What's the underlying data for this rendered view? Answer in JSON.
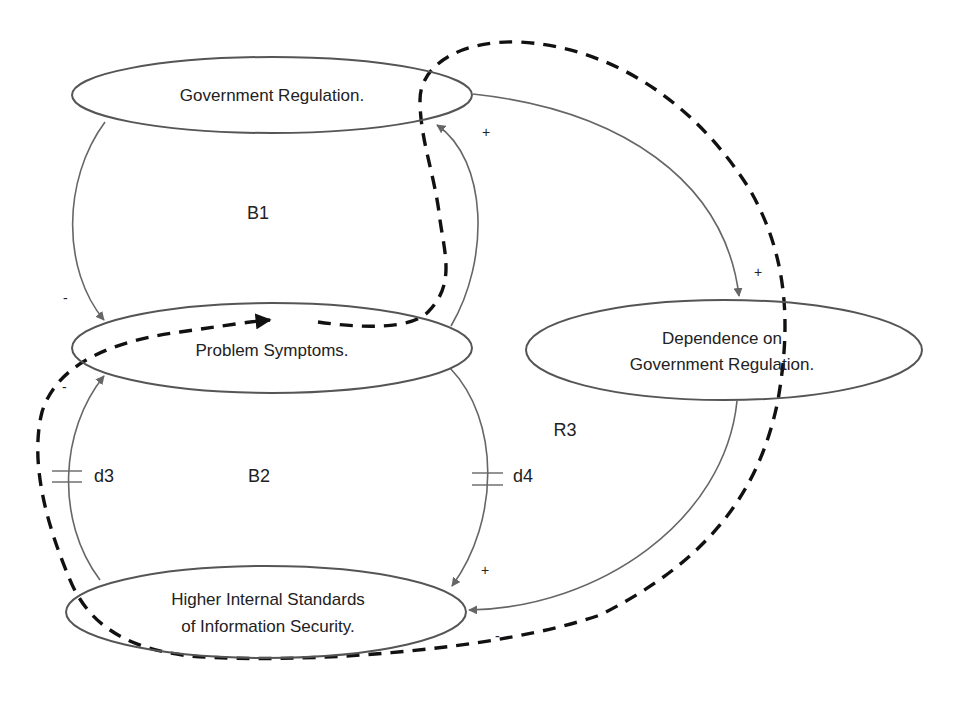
{
  "diagram": {
    "type": "causal-loop-diagram",
    "colors": {
      "background": "#ffffff",
      "node_stroke": "#555555",
      "link_stroke": "#666666",
      "arrowhead": "#666666",
      "dashed_loop": "#111111",
      "text": "#222222"
    },
    "nodes": [
      {
        "id": "gov_reg",
        "lines": [
          "Government Regulation."
        ]
      },
      {
        "id": "problem",
        "lines": [
          "Problem Symptoms."
        ]
      },
      {
        "id": "dependence",
        "lines": [
          "Dependence on",
          "Government Regulation."
        ]
      },
      {
        "id": "standards",
        "lines": [
          "Higher Internal Standards",
          "of Information Security."
        ]
      }
    ],
    "loops": [
      {
        "id": "B1",
        "label": "B1"
      },
      {
        "id": "B2",
        "label": "B2"
      },
      {
        "id": "R3",
        "label": "R3"
      }
    ],
    "delays": [
      {
        "id": "d3",
        "label": "d3"
      },
      {
        "id": "d4",
        "label": "d4"
      }
    ],
    "links": [
      {
        "from": "gov_reg",
        "to": "problem",
        "polarity": "-"
      },
      {
        "from": "problem",
        "to": "gov_reg",
        "polarity": "+"
      },
      {
        "from": "gov_reg",
        "to": "dependence",
        "polarity": "+"
      },
      {
        "from": "problem",
        "to": "standards",
        "polarity": "+",
        "delay": "d4"
      },
      {
        "from": "standards",
        "to": "problem",
        "polarity": "-",
        "delay": "d3"
      },
      {
        "from": "dependence",
        "to": "standards",
        "polarity": "-"
      }
    ],
    "signs": {
      "b1_minus": "-",
      "gov_to_problem_plus": "+",
      "gov_to_dependence_plus": "+",
      "d3_minus": "-",
      "d4_plus": "+",
      "dependence_minus": "-"
    }
  }
}
